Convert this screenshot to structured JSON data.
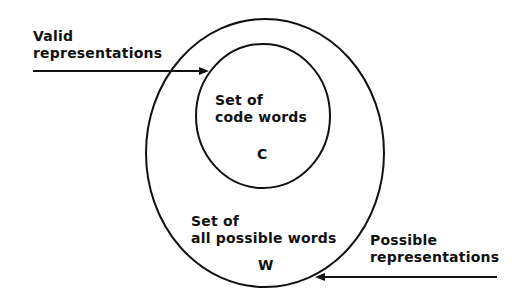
{
  "diagram": {
    "labels": {
      "valid_line1": "Valid",
      "valid_line2": "representations",
      "inner_line1": "Set of",
      "inner_line2": "code words",
      "inner_symbol": "C",
      "outer_line1": "Set of",
      "outer_line2": "all possible words",
      "outer_symbol": "W",
      "possible_line1": "Possible",
      "possible_line2": "representations"
    },
    "colors": {
      "stroke": "#111111",
      "background": "#ffffff"
    }
  }
}
